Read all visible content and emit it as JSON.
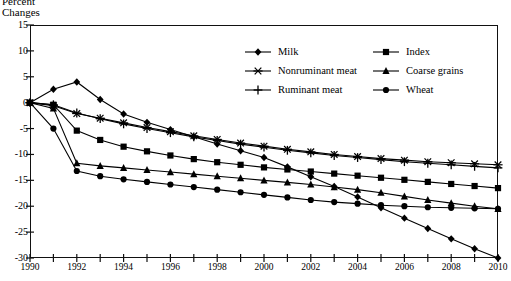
{
  "axis_title": {
    "line1": "Percent",
    "line2": "Changes"
  },
  "y_ticks": [
    15,
    10,
    5,
    0,
    -5,
    -10,
    -15,
    -20,
    -25,
    -30
  ],
  "x_ticks_labeled": [
    1990,
    1992,
    1994,
    1996,
    1998,
    2000,
    2002,
    2004,
    2006,
    2008,
    2010
  ],
  "legend": {
    "col1": [
      {
        "label": "Milk",
        "marker": "diamond"
      },
      {
        "label": "Nonruminant meat",
        "marker": "asterisk"
      },
      {
        "label": "Ruminant meat",
        "marker": "plus"
      }
    ],
    "col2": [
      {
        "label": "Index",
        "marker": "square"
      },
      {
        "label": "Coarse grains",
        "marker": "triangle"
      },
      {
        "label": "Wheat",
        "marker": "circle"
      }
    ]
  },
  "chart_data": {
    "type": "line",
    "title": "",
    "xlabel": "",
    "ylabel": "Percent Changes",
    "xlim": [
      1990,
      2010
    ],
    "ylim": [
      -30,
      15
    ],
    "grid": false,
    "legend_position": "top-center",
    "x": [
      1990,
      1991,
      1992,
      1993,
      1994,
      1995,
      1996,
      1997,
      1998,
      1999,
      2000,
      2001,
      2002,
      2003,
      2004,
      2005,
      2006,
      2007,
      2008,
      2009,
      2010
    ],
    "series": [
      {
        "name": "Milk",
        "marker": "diamond",
        "values": [
          0,
          2.6,
          4.0,
          0.6,
          -2.2,
          -3.8,
          -5.2,
          -6.6,
          -8.0,
          -9.3,
          -10.6,
          -12.4,
          -14.3,
          -16.2,
          -18.2,
          -20.3,
          -22.3,
          -24.3,
          -26.3,
          -28.2,
          -30.0
        ]
      },
      {
        "name": "Nonruminant meat",
        "marker": "asterisk",
        "values": [
          0,
          -0.6,
          -2.1,
          -3.0,
          -3.9,
          -4.8,
          -5.6,
          -6.4,
          -7.1,
          -7.8,
          -8.4,
          -9.0,
          -9.5,
          -10.0,
          -10.4,
          -10.8,
          -11.1,
          -11.4,
          -11.6,
          -11.8,
          -12.0
        ]
      },
      {
        "name": "Ruminant meat",
        "marker": "plus",
        "values": [
          0,
          -0.4,
          -2.0,
          -3.1,
          -4.1,
          -5.0,
          -5.8,
          -6.6,
          -7.3,
          -8.0,
          -8.6,
          -9.2,
          -9.7,
          -10.2,
          -10.6,
          -11.0,
          -11.4,
          -11.7,
          -12.0,
          -12.3,
          -12.6
        ]
      },
      {
        "name": "Index",
        "marker": "square",
        "values": [
          0,
          -0.4,
          -5.4,
          -7.2,
          -8.5,
          -9.4,
          -10.2,
          -10.9,
          -11.5,
          -12.0,
          -12.5,
          -12.9,
          -13.3,
          -13.7,
          -14.1,
          -14.5,
          -14.9,
          -15.3,
          -15.7,
          -16.1,
          -16.5
        ]
      },
      {
        "name": "Coarse grains",
        "marker": "triangle",
        "values": [
          0,
          -1.1,
          -11.7,
          -12.2,
          -12.6,
          -13.0,
          -13.4,
          -13.8,
          -14.2,
          -14.6,
          -15.0,
          -15.4,
          -15.8,
          -16.3,
          -16.8,
          -17.4,
          -18.1,
          -18.8,
          -19.4,
          -20.0,
          -20.5
        ]
      },
      {
        "name": "Wheat",
        "marker": "circle",
        "values": [
          0,
          -5.0,
          -13.2,
          -14.2,
          -14.8,
          -15.3,
          -15.8,
          -16.3,
          -16.8,
          -17.3,
          -17.8,
          -18.3,
          -18.8,
          -19.2,
          -19.5,
          -19.8,
          -20.0,
          -20.2,
          -20.3,
          -20.4,
          -20.5
        ]
      }
    ]
  }
}
